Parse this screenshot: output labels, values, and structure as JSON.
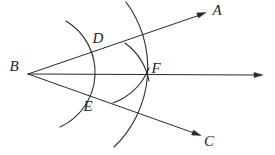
{
  "figure": {
    "kind": "geometry-construction-angle-bisector",
    "background_color": "#ffffff",
    "stroke_color": "#2a2a2a",
    "points": {
      "A": {
        "label": "A"
      },
      "B": {
        "label": "B"
      },
      "C": {
        "label": "C"
      },
      "D": {
        "label": "D"
      },
      "E": {
        "label": "E"
      },
      "F": {
        "label": "F"
      }
    },
    "rays": [
      {
        "name": "ray-B-to-A",
        "d": "M 28 74 L 200 15",
        "arrow": "M 206 12.5 L 198.4 17.9 L 196.7 12.9 Z"
      },
      {
        "name": "ray-B-through-F-horizontal",
        "d": "M 28 74 L 256 75",
        "arrow": "M 263 75 L 254 72.4 L 254 77.6 Z"
      },
      {
        "name": "ray-B-to-C",
        "d": "M 28 74 L 194 133",
        "arrow": "M 201 135.5 L 191.6 135 L 193.4 130.1 Z"
      }
    ],
    "arcs": [
      {
        "name": "arc-center-B-through-D-E",
        "d": "M 66 21 A 60 60 0 0 1 60 127"
      },
      {
        "name": "arc-center-B-through-F-tall",
        "d": "M 126 2 A 110 110 0 0 1 114 147"
      },
      {
        "name": "arc-center-E-through-F",
        "d": "M 125 43 A 62 62 0 0 1 149 81"
      },
      {
        "name": "arc-center-D-through-F",
        "d": "M 149 68 A 62 62 0 0 1 113 103"
      }
    ]
  }
}
